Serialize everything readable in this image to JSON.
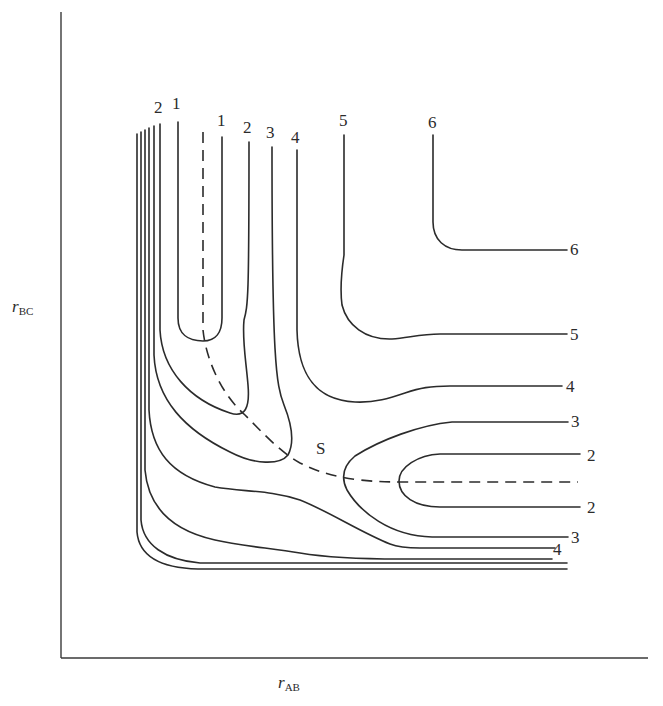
{
  "diagram": {
    "type": "potential-energy-surface-contour-map",
    "axes": {
      "x_label_main": "r",
      "x_label_sub": "AB",
      "y_label_main": "r",
      "y_label_sub": "BC",
      "x_axis": {
        "x1": 61,
        "y1": 658,
        "x2": 648,
        "y2": 658
      },
      "y_axis": {
        "x1": 61,
        "y1": 12,
        "x2": 61,
        "y2": 658
      }
    },
    "saddle_point_label": "S",
    "saddle_point_label_pos": {
      "x": 316,
      "y": 454
    },
    "reaction_path": {
      "style": "dashed",
      "d": "M203,132 L203,330 C206,360 222,395 245,415 C262,432 280,452 300,463 C318,472 335,477 360,480 C378,482 390,482 405,482 L578,482"
    },
    "contours": [
      {
        "level": "1",
        "description": "inner loop near top-left",
        "d": "M178,122 L178,318 C178,334 188,341 203,341 C216,341 222,332 222,318 L222,137"
      },
      {
        "level": "2",
        "description": "left 2 loop joining top label 2",
        "d": "M160,124 L160,330 C162,370 190,400 230,413 C245,418 250,408 248,385 C246,360 242,340 244,320 C248,305 249,300 249,142"
      },
      {
        "level": "3",
        "description": "left 3 loop joining top label 3",
        "d": "M154,126 L154,355 C156,400 185,430 230,452 C255,465 280,465 288,455 C296,440 290,420 284,405 C276,385 272,360 272,147"
      },
      {
        "level": "4",
        "description": "top 4 descending, curving to right 4",
        "d": "M297,150 L297,330 C298,370 312,400 355,402 C375,403 390,398 405,393 C420,388 430,386 450,386 L562,386"
      },
      {
        "level": "5",
        "description": "top 5 descending, curving to right 5",
        "d": "M344,135 L344,255 C341,275 340,290 342,305 C347,325 365,340 392,339 C408,338 420,334 440,334 L567,334"
      },
      {
        "level": "6",
        "description": "top 6 descending, curving to right 6",
        "d": "M433,135 L433,222 C433,240 445,250 462,250 L567,250"
      },
      {
        "level": "3",
        "description": "right 3 loop (upper and lower arms)",
        "d": "M568,422 L452,422 C420,425 380,440 355,456 C343,466 341,478 347,490 C360,512 390,536 432,537 L568,537"
      },
      {
        "level": "2",
        "description": "right 2 loop (upper and lower arms)",
        "d": "M580,454 L440,454 C418,455 399,467 399,481 C399,496 415,507 440,507 L580,507"
      },
      {
        "level": "4",
        "description": "lower 4 from left bundle",
        "d": "M149,128 L149,410 C151,450 170,475 215,487 C245,492 270,490 300,500 C330,512 360,532 390,544 C400,548 410,548 420,548 L555,548"
      },
      {
        "level": "",
        "description": "lower bundle line (unlabeled)",
        "d": "M145,130 L145,470 C148,505 170,530 215,540 C240,546 270,548 300,553 C330,558 360,559 400,559 L552,559"
      },
      {
        "level": "",
        "description": "lower bundle line (unlabeled)",
        "d": "M141,132 L141,520 C143,545 165,560 200,563 L567,563"
      },
      {
        "level": "",
        "description": "outermost bundle line (unlabeled)",
        "d": "M137,134 L137,532 C139,556 160,568 198,569 L567,569"
      }
    ],
    "top_labels": [
      {
        "text": "2",
        "x": 154,
        "y": 113
      },
      {
        "text": "1",
        "x": 172,
        "y": 109
      },
      {
        "text": "1",
        "x": 217,
        "y": 126
      },
      {
        "text": "2",
        "x": 243,
        "y": 133
      },
      {
        "text": "3",
        "x": 266,
        "y": 138
      },
      {
        "text": "4",
        "x": 291,
        "y": 143
      },
      {
        "text": "5",
        "x": 339,
        "y": 126
      },
      {
        "text": "6",
        "x": 428,
        "y": 128
      }
    ],
    "right_labels": [
      {
        "text": "6",
        "x": 570,
        "y": 255
      },
      {
        "text": "5",
        "x": 570,
        "y": 340
      },
      {
        "text": "4",
        "x": 566,
        "y": 392
      },
      {
        "text": "3",
        "x": 571,
        "y": 427
      },
      {
        "text": "2",
        "x": 587,
        "y": 461
      },
      {
        "text": "2",
        "x": 587,
        "y": 513
      },
      {
        "text": "3",
        "x": 571,
        "y": 543
      },
      {
        "text": "4",
        "x": 553,
        "y": 555
      }
    ]
  }
}
